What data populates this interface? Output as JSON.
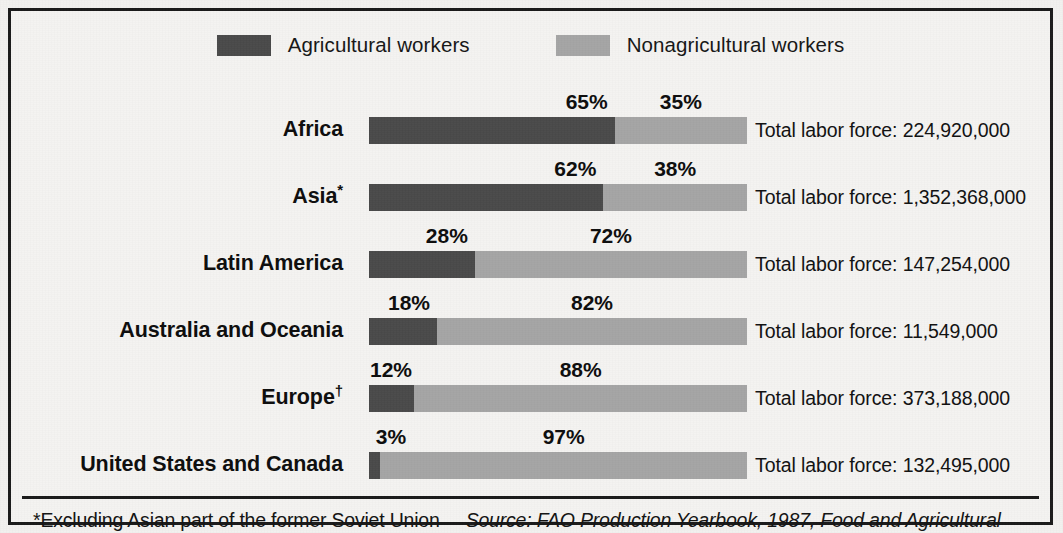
{
  "chart_data": {
    "type": "bar",
    "subtype": "stacked-horizontal-100percent",
    "title": "",
    "xlabel": "",
    "ylabel": "",
    "grid": false,
    "legend_position": "top-center",
    "xlim": [
      0,
      100
    ],
    "categories": [
      "Africa",
      "Asia*",
      "Latin America",
      "Australia and Oceania",
      "Europe†",
      "United States and Canada"
    ],
    "series": [
      {
        "name": "Agricultural workers",
        "color": "#4a4a4a",
        "values": [
          65,
          62,
          28,
          18,
          12,
          3
        ]
      },
      {
        "name": "Nonagricultural workers",
        "color": "#a5a5a5",
        "values": [
          35,
          38,
          72,
          82,
          88,
          97
        ]
      }
    ],
    "annotations": [
      "Total labor force: 224,920,000",
      "Total labor force: 1,352,368,000",
      "Total labor force: 147,254,000",
      "Total labor force: 11,549,000",
      "Total labor force: 373,188,000",
      "Total labor force: 132,495,000"
    ]
  },
  "legend": {
    "entries": [
      {
        "label": "Agricultural workers",
        "color": "#4a4a4a"
      },
      {
        "label": "Nonagricultural workers",
        "color": "#a5a5a5"
      }
    ]
  },
  "rows": [
    {
      "label": "Africa",
      "label_main": "Africa",
      "label_mark": "",
      "ag_pct": "65%",
      "nonag_pct": "35%",
      "ag_value": 65,
      "nonag_value": 35,
      "total": "Total labor force: 224,920,000"
    },
    {
      "label": "Asia*",
      "label_main": "Asia",
      "label_mark": "*",
      "ag_pct": "62%",
      "nonag_pct": "38%",
      "ag_value": 62,
      "nonag_value": 38,
      "total": "Total labor force: 1,352,368,000"
    },
    {
      "label": "Latin America",
      "label_main": "Latin America",
      "label_mark": "",
      "ag_pct": "28%",
      "nonag_pct": "72%",
      "ag_value": 28,
      "nonag_value": 72,
      "total": "Total labor force: 147,254,000"
    },
    {
      "label": "Australia and Oceania",
      "label_main": "Australia and Oceania",
      "label_mark": "",
      "ag_pct": "18%",
      "nonag_pct": "82%",
      "ag_value": 18,
      "nonag_value": 82,
      "total": "Total labor force: 11,549,000"
    },
    {
      "label": "Europe†",
      "label_main": "Europe",
      "label_mark": "†",
      "ag_pct": "12%",
      "nonag_pct": "88%",
      "ag_value": 12,
      "nonag_value": 88,
      "total": "Total labor force: 373,188,000"
    },
    {
      "label": "United States and Canada",
      "label_main": "United States and Canada",
      "label_mark": "",
      "ag_pct": "3%",
      "nonag_pct": "97%",
      "ag_value": 3,
      "nonag_value": 97,
      "total": "Total labor force: 132,495,000"
    }
  ],
  "footer": {
    "footnote": "*Excluding Asian part of the former Soviet Union",
    "source": "Source: FAO Production Yearbook, 1987, Food and Agricultural"
  },
  "colors": {
    "agricultural": "#4a4a4a",
    "nonagricultural": "#a5a5a5",
    "frame": "#1a1a1a",
    "background": "#f4f3f1",
    "text": "#111111"
  }
}
